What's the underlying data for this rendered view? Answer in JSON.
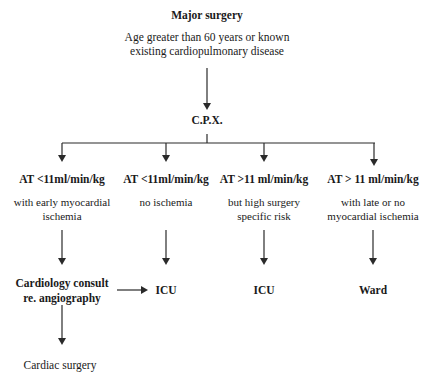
{
  "diagram": {
    "type": "flowchart",
    "root": {
      "title": "Major surgery",
      "criteria_line1": "Age greater than 60 years or known",
      "criteria_line2": "existing cardiopulmonary disease"
    },
    "test": {
      "label": "C.P.X."
    },
    "branches": [
      {
        "threshold": "AT <11ml/min/kg",
        "condition_line1": "with early myocardial",
        "condition_line2": "ischemia",
        "outcome_line1": "Cardiology consult",
        "outcome_line2": "re. angiography"
      },
      {
        "threshold": "AT <11ml/min/kg",
        "condition_line1": "no ischemia",
        "condition_line2": "",
        "outcome_line1": "ICU",
        "outcome_line2": ""
      },
      {
        "threshold": "AT >11 ml/min/kg",
        "condition_line1": "but high surgery",
        "condition_line2": "specific risk",
        "outcome_line1": "ICU",
        "outcome_line2": ""
      },
      {
        "threshold": "AT > 11 ml/min/kg",
        "condition_line1": "with late or no",
        "condition_line2": "myocardial ischemia",
        "outcome_line1": "Ward",
        "outcome_line2": ""
      }
    ],
    "final": {
      "label": "Cardiac surgery"
    },
    "colors": {
      "line": "#2a2a2a",
      "text": "#1a1a1a",
      "background": "#ffffff"
    }
  }
}
